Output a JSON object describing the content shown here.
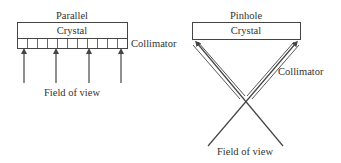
{
  "parallel": {
    "title": "Parallel",
    "crystal_label": "Crystal",
    "collimator_label": "Collimator",
    "field_of_view_label": "Field of view",
    "collimator_cells": 11,
    "arrow_count": 4
  },
  "pinhole": {
    "title": "Pinhole",
    "crystal_label": "Crystal",
    "collimator_label": "Collimator",
    "field_of_view_label": "Field of view"
  },
  "colors": {
    "line": "#444444",
    "text": "#333333",
    "background": "#ffffff"
  }
}
